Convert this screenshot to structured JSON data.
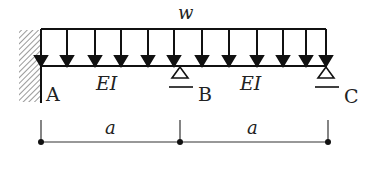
{
  "diagram": {
    "type": "beam",
    "load": {
      "label": "w",
      "kind": "uniformly distributed"
    },
    "beam": {
      "segments": [
        {
          "from": "A",
          "to": "B",
          "stiffness_label": "EI",
          "length_label": "a"
        },
        {
          "from": "B",
          "to": "C",
          "stiffness_label": "EI",
          "length_label": "a"
        }
      ]
    },
    "supports": [
      {
        "point": "A",
        "label": "A",
        "type": "fixed"
      },
      {
        "point": "B",
        "label": "B",
        "type": "roller"
      },
      {
        "point": "C",
        "label": "C",
        "type": "roller"
      }
    ],
    "dimensions": [
      {
        "label": "a"
      },
      {
        "label": "a"
      }
    ],
    "colors": {
      "stroke": "#111111",
      "text": "#222222",
      "hatch": "#555555"
    }
  }
}
